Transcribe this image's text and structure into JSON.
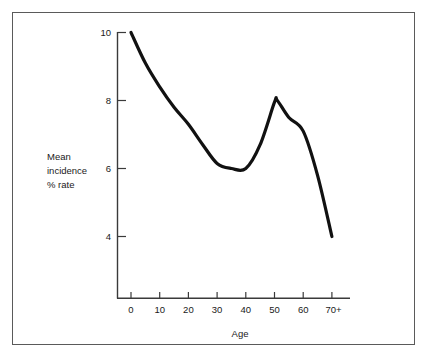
{
  "chart_data": {
    "type": "line",
    "title": "",
    "subtitle": "",
    "xlabel": "Age",
    "ylabel": "Mean\nincidence\n% rate",
    "ylabel_lines": [
      "Mean",
      "incidence",
      "% rate"
    ],
    "x_tick_labels": [
      "0",
      "10",
      "20",
      "30",
      "40",
      "50",
      "60",
      "70+"
    ],
    "x_tick_values": [
      0,
      10,
      20,
      30,
      40,
      50,
      60,
      70
    ],
    "y_tick_labels": [
      "10",
      "8",
      "6",
      "4"
    ],
    "y_tick_values": [
      10,
      8,
      6,
      4
    ],
    "xlim": [
      0,
      70
    ],
    "ylim": [
      3.0,
      10.35
    ],
    "grid": false,
    "legend": null,
    "series": [
      {
        "name": "Mean incidence % rate",
        "x": [
          0,
          5,
          10,
          15,
          20,
          25,
          30,
          35,
          40,
          45,
          50,
          51,
          55,
          60,
          65,
          70
        ],
        "values": [
          10.0,
          9.1,
          8.4,
          7.8,
          7.3,
          6.7,
          6.15,
          6.0,
          6.0,
          6.7,
          7.95,
          8.0,
          7.5,
          7.1,
          5.8,
          4.0
        ],
        "color": "#111111",
        "line_width": 3.2
      }
    ],
    "annotations": [
      {
        "label": "start",
        "x": 0,
        "y": 10.0
      },
      {
        "label": "trough",
        "x": 37,
        "y": 6.0
      },
      {
        "label": "peak",
        "x": 51,
        "y": 8.0
      },
      {
        "label": "end",
        "x": 70,
        "y": 4.0
      }
    ]
  },
  "figure": {
    "background_color": "#ffffff",
    "frame_color": "#5a5a5a",
    "axis_color": "#3a3a3a",
    "text_color": "#1a1a1a",
    "curve_color": "#111111"
  }
}
